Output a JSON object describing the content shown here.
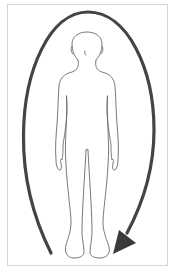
{
  "figure": {
    "description": "Front-view outline of a standing human figure encircled by a clockwise arrow",
    "frame_color": "#d4d4d4",
    "arrow_color": "#444444",
    "outline_color": "#6a6a6a",
    "arrow_direction": "clockwise"
  }
}
